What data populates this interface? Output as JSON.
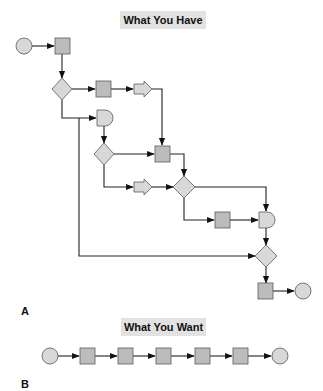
{
  "panel_a": {
    "title": "What You Have",
    "label": "A",
    "nodes": [
      {
        "id": "start",
        "type": "circle"
      },
      {
        "id": "task1",
        "type": "process"
      },
      {
        "id": "decision1",
        "type": "decision"
      },
      {
        "id": "task2",
        "type": "process"
      },
      {
        "id": "offpage1",
        "type": "offpage-arrow"
      },
      {
        "id": "delay1",
        "type": "delay"
      },
      {
        "id": "decision2",
        "type": "decision"
      },
      {
        "id": "task3",
        "type": "process"
      },
      {
        "id": "offpage2",
        "type": "offpage-arrow"
      },
      {
        "id": "decision3",
        "type": "decision"
      },
      {
        "id": "task4",
        "type": "process"
      },
      {
        "id": "delay2",
        "type": "delay"
      },
      {
        "id": "decision4",
        "type": "decision"
      },
      {
        "id": "task5",
        "type": "process"
      },
      {
        "id": "end",
        "type": "circle"
      }
    ]
  },
  "panel_b": {
    "title": "What You Want",
    "label": "B",
    "nodes": [
      {
        "id": "start",
        "type": "circle"
      },
      {
        "id": "step1",
        "type": "process"
      },
      {
        "id": "step2",
        "type": "process"
      },
      {
        "id": "step3",
        "type": "process"
      },
      {
        "id": "step4",
        "type": "process"
      },
      {
        "id": "step5",
        "type": "process"
      },
      {
        "id": "end",
        "type": "circle"
      }
    ]
  },
  "colors": {
    "process_fill": "#bcbcbc",
    "shape_fill": "#d8d8d8",
    "stroke": "#5a5a5a",
    "title_bg": "#e2e2e2"
  }
}
